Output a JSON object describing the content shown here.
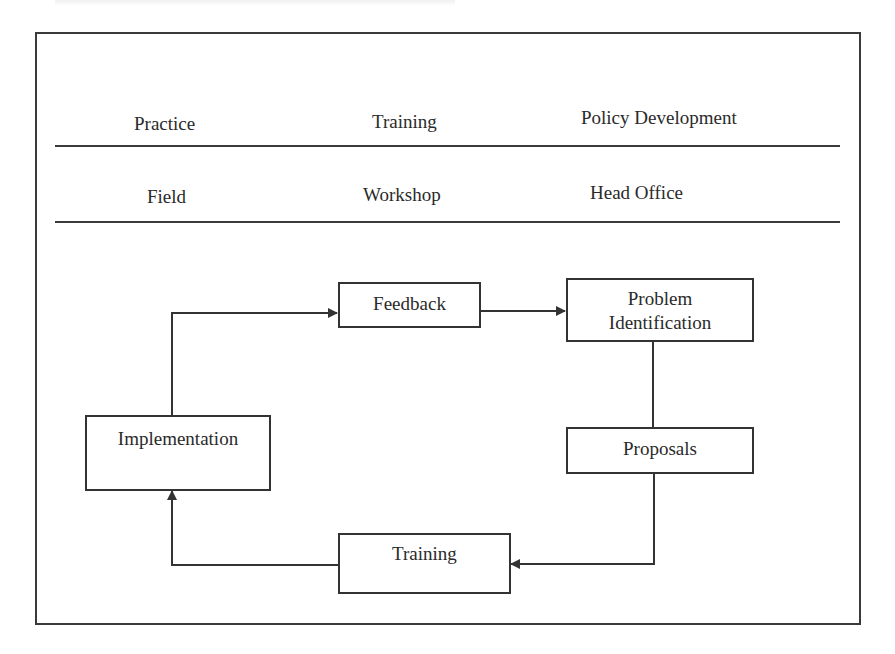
{
  "header": {
    "columns": [
      {
        "level": "Practice",
        "location": "Field"
      },
      {
        "level": "Training",
        "location": "Workshop"
      },
      {
        "level": "Policy Development",
        "location": "Head Office"
      }
    ]
  },
  "diagram": {
    "nodes": {
      "feedback": "Feedback",
      "problem_identification_line1": "Problem",
      "problem_identification_line2": "Identification",
      "proposals": "Proposals",
      "training": "Training",
      "implementation": "Implementation"
    },
    "edges": [
      {
        "from": "Implementation",
        "to": "Feedback",
        "arrow": true
      },
      {
        "from": "Feedback",
        "to": "Problem Identification",
        "arrow": true
      },
      {
        "from": "Problem Identification",
        "to": "Proposals",
        "arrow": false
      },
      {
        "from": "Proposals",
        "to": "Training",
        "arrow": true
      },
      {
        "from": "Training",
        "to": "Implementation",
        "arrow": true
      }
    ],
    "line_color": "#333333"
  }
}
